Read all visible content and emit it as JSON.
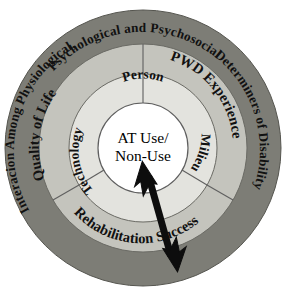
{
  "diagram": {
    "type": "concentric-rings",
    "background_color": "#ffffff",
    "center": {
      "label_line_1": "AT Use/",
      "label_line_2": "Non-Use",
      "fill_color": "#ffffff"
    },
    "inner_ring": {
      "fill_color": "#e3e3de",
      "segments": [
        {
          "id": "person",
          "label": "Person",
          "position": "top"
        },
        {
          "id": "milieu",
          "label": "Milieu",
          "position": "right"
        },
        {
          "id": "technology",
          "label": "Technology",
          "position": "left"
        }
      ]
    },
    "middle_ring": {
      "fill_color": "#c4c4bd",
      "segments": [
        {
          "id": "quality-of-life",
          "label": "Quality of Life",
          "position": "upper-left"
        },
        {
          "id": "pwd-experience",
          "label": "PWD Experience",
          "position": "upper-right"
        },
        {
          "id": "rehabilitation-success",
          "label": "Rehabilitation Success",
          "position": "bottom"
        }
      ]
    },
    "outer_ring": {
      "fill_color": "#7d7d76",
      "label": "Interacion Among Physiological, Psychological and Psychosocial Determiners of Disability",
      "label_parts": {
        "left_upward": "Interacion Among Physiological,",
        "top": "Psychological and Psychosocial",
        "right_downward": "Determiners of Disability"
      }
    },
    "arrow": {
      "id": "double-headed-arrow",
      "color": "#0d0d0d",
      "direction": "double",
      "from": "center",
      "to": "outer-ring-lower-right"
    }
  }
}
